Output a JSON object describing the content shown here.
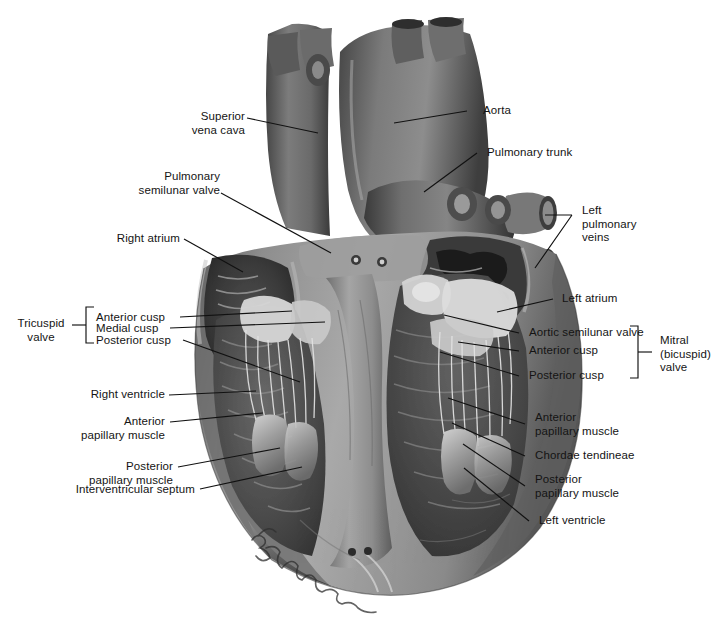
{
  "figure": {
    "background_color": "#ffffff",
    "label_color": "#141414",
    "leader_color": "#111111",
    "width": 727,
    "height": 631,
    "artist_signature": "R. J. Demarest"
  },
  "labels": {
    "superior_vena_cava": "Superior\nvena cava",
    "pulmonary_semilunar_valve": "Pulmonary\nsemilunar valve",
    "right_atrium": "Right atrium",
    "tricuspid_valve": "Tricuspid\nvalve",
    "anterior_cusp_left": "Anterior cusp",
    "medial_cusp": "Medial cusp",
    "posterior_cusp_left": "Posterior cusp",
    "right_ventricle": "Right ventricle",
    "anterior_papillary_muscle_left": "Anterior\npapillary muscle",
    "posterior_papillary_muscle_left": "Posterior\npapillary muscle",
    "interventricular_septum": "Interventricular septum",
    "aorta": "Aorta",
    "pulmonary_trunk": "Pulmonary trunk",
    "left_pulmonary_veins": "Left\npulmonary\nveins",
    "left_atrium": "Left atrium",
    "aortic_semilunar_valve": "Aortic semilunar valve",
    "anterior_cusp_right": "Anterior cusp",
    "posterior_cusp_right": "Posterior cusp",
    "mitral_valve": "Mitral\n(bicuspid)\nvalve",
    "anterior_papillary_muscle_right": "Anterior\npapillary muscle",
    "chordae_tendineae": "Chordae tendineae",
    "posterior_papillary_muscle_right": "Posterior\npapillary muscle",
    "left_ventricle": "Left ventricle"
  },
  "anatomy_parts": [
    "superior vena cava",
    "aorta",
    "pulmonary trunk",
    "left pulmonary veins",
    "right atrium",
    "left atrium",
    "right ventricle",
    "left ventricle",
    "tricuspid valve",
    "mitral (bicuspid) valve",
    "pulmonary semilunar valve",
    "aortic semilunar valve",
    "chordae tendineae",
    "anterior papillary muscle",
    "posterior papillary muscle",
    "medial cusp",
    "interventricular septum"
  ],
  "brackets": {
    "tricuspid_valve_groups": [
      "Anterior cusp",
      "Medial cusp",
      "Posterior cusp"
    ],
    "mitral_valve_groups": [
      "Aortic semilunar valve",
      "Anterior cusp",
      "Posterior cusp"
    ]
  }
}
